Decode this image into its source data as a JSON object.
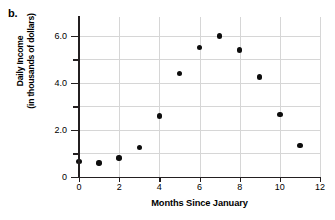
{
  "part_label": "b.",
  "chart_data": {
    "type": "scatter",
    "title": "",
    "xlabel": "Months Since January",
    "ylabel": "Daily Income (in thousands of dollars)",
    "ylabel_lines": [
      "Daily Income",
      "(in thousands of dollars)"
    ],
    "xlim": [
      0,
      12
    ],
    "ylim": [
      0,
      6.8
    ],
    "xticks": [
      0,
      2,
      4,
      6,
      8,
      10,
      12
    ],
    "xtick_labels": [
      "0",
      "2",
      "4",
      "6",
      "8",
      "10",
      "12"
    ],
    "yticks": [
      0,
      2.0,
      4.0,
      6.0
    ],
    "ytick_labels": [
      "0",
      "2.0",
      "4.0",
      "6.0"
    ],
    "yticks_minor": [
      1.0,
      3.0,
      5.0
    ],
    "grid": true,
    "grid_x": [
      0,
      2,
      4,
      6,
      8,
      10,
      12
    ],
    "grid_y": [
      1.0,
      2.0,
      3.0,
      4.0,
      5.0,
      6.0
    ],
    "legend": null,
    "marker_color": "#0d0d0d",
    "grid_color": "#d6d6d6",
    "axis_color": "#231f20",
    "x": [
      0,
      1,
      2,
      3,
      4,
      5,
      6,
      7,
      8,
      9,
      10,
      11
    ],
    "values": [
      0.65,
      0.6,
      0.8,
      1.25,
      2.6,
      4.4,
      5.5,
      6.0,
      5.4,
      4.25,
      2.65,
      1.35
    ],
    "points": [
      {
        "x": 0,
        "y": 0.65
      },
      {
        "x": 1,
        "y": 0.6
      },
      {
        "x": 2,
        "y": 0.8
      },
      {
        "x": 3,
        "y": 1.25
      },
      {
        "x": 4,
        "y": 2.6
      },
      {
        "x": 5,
        "y": 4.4
      },
      {
        "x": 6,
        "y": 5.5
      },
      {
        "x": 7,
        "y": 6.0
      },
      {
        "x": 8,
        "y": 5.4
      },
      {
        "x": 9,
        "y": 4.25
      },
      {
        "x": 10,
        "y": 2.65
      },
      {
        "x": 11,
        "y": 1.35
      }
    ]
  }
}
